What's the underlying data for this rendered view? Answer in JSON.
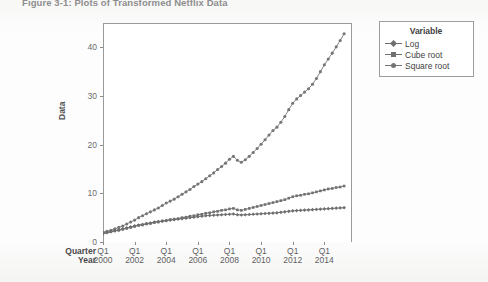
{
  "figure": {
    "title": "Figure 3-1: Plots of Transformed Netflix Data",
    "background_color": "#fbfbfa",
    "plot_background_color": "#ffffff",
    "axis_color": "#9a9a9a"
  },
  "legend": {
    "title": "Variable",
    "entries": [
      {
        "label": "Log",
        "color": "#6e6e6e",
        "marker": "diamond"
      },
      {
        "label": "Cube root",
        "color": "#707070",
        "marker": "square"
      },
      {
        "label": "Square root",
        "color": "#757575",
        "marker": "circle"
      }
    ]
  },
  "axes": {
    "y_title": "Data",
    "y_ticks": [
      "0",
      "10",
      "20",
      "30",
      "40"
    ],
    "x_row_headers": [
      "Quarter",
      "Year"
    ],
    "x_quarters": [
      "Q1",
      "Q1",
      "Q1",
      "Q1",
      "Q1",
      "Q1",
      "Q1",
      "Q1"
    ],
    "x_years": [
      "2000",
      "2002",
      "2004",
      "2006",
      "2008",
      "2010",
      "2012",
      "2014"
    ]
  },
  "chart_data": {
    "type": "line",
    "title": "Figure 3-1: Plots of Transformed Netflix Data",
    "xlabel": "Quarter / Year",
    "ylabel": "Data",
    "ylim": [
      0,
      45
    ],
    "xlim": [
      0,
      63
    ],
    "grid": false,
    "legend_position": "right-outside",
    "legend_title": "Variable",
    "x_tick_values": [
      0,
      8,
      16,
      24,
      32,
      40,
      48,
      56
    ],
    "x_tick_labels": [
      "Q1 2000",
      "Q1 2002",
      "Q1 2004",
      "Q1 2006",
      "Q1 2008",
      "Q1 2010",
      "Q1 2012",
      "Q1 2014"
    ],
    "y_tick_values": [
      0,
      10,
      20,
      30,
      40
    ],
    "x": [
      0,
      1,
      2,
      3,
      4,
      5,
      6,
      7,
      8,
      9,
      10,
      11,
      12,
      13,
      14,
      15,
      16,
      17,
      18,
      19,
      20,
      21,
      22,
      23,
      24,
      25,
      26,
      27,
      28,
      29,
      30,
      31,
      32,
      33,
      34,
      35,
      36,
      37,
      38,
      39,
      40,
      41,
      42,
      43,
      44,
      45,
      46,
      47,
      48,
      49,
      50,
      51,
      52,
      53,
      54,
      55,
      56,
      57,
      58,
      59,
      60,
      61
    ],
    "series": [
      {
        "name": "Square root",
        "marker": "circle",
        "color": "#757575",
        "values": [
          2.0,
          2.2,
          2.4,
          2.7,
          3.0,
          3.3,
          3.7,
          4.1,
          4.5,
          5.0,
          5.4,
          5.8,
          6.2,
          6.6,
          7.0,
          7.5,
          8.0,
          8.4,
          8.8,
          9.3,
          9.8,
          10.3,
          10.8,
          11.4,
          11.9,
          12.4,
          13.0,
          13.6,
          14.2,
          14.9,
          15.5,
          16.2,
          17.0,
          17.6,
          16.8,
          16.4,
          16.9,
          17.6,
          18.4,
          19.2,
          20.1,
          21.0,
          22.0,
          22.9,
          23.6,
          24.6,
          25.8,
          27.2,
          28.5,
          29.4,
          30.1,
          30.8,
          31.5,
          32.4,
          33.6,
          35.0,
          36.4,
          37.6,
          38.8,
          40.1,
          41.4,
          42.8
        ]
      },
      {
        "name": "Cube root",
        "marker": "square",
        "color": "#707070",
        "values": [
          1.9,
          2.0,
          2.1,
          2.3,
          2.4,
          2.6,
          2.8,
          3.0,
          3.2,
          3.4,
          3.5,
          3.7,
          3.8,
          4.0,
          4.1,
          4.3,
          4.4,
          4.6,
          4.7,
          4.8,
          5.0,
          5.1,
          5.3,
          5.4,
          5.6,
          5.7,
          5.9,
          6.0,
          6.2,
          6.3,
          6.5,
          6.6,
          6.8,
          6.9,
          6.6,
          6.5,
          6.7,
          6.9,
          7.1,
          7.3,
          7.5,
          7.7,
          7.9,
          8.1,
          8.3,
          8.5,
          8.7,
          9.0,
          9.3,
          9.5,
          9.6,
          9.8,
          9.9,
          10.1,
          10.3,
          10.5,
          10.7,
          10.9,
          11.0,
          11.2,
          11.3,
          11.5
        ]
      },
      {
        "name": "Log",
        "marker": "diamond",
        "color": "#6e6e6e",
        "values": [
          1.7,
          1.9,
          2.1,
          2.3,
          2.5,
          2.7,
          2.9,
          3.1,
          3.3,
          3.5,
          3.6,
          3.8,
          3.9,
          4.1,
          4.2,
          4.3,
          4.4,
          4.5,
          4.6,
          4.7,
          4.8,
          4.9,
          5.0,
          5.1,
          5.2,
          5.3,
          5.4,
          5.45,
          5.5,
          5.55,
          5.6,
          5.65,
          5.7,
          5.75,
          5.6,
          5.55,
          5.6,
          5.65,
          5.7,
          5.75,
          5.8,
          5.85,
          5.9,
          5.95,
          6.0,
          6.1,
          6.2,
          6.3,
          6.4,
          6.45,
          6.5,
          6.55,
          6.6,
          6.65,
          6.7,
          6.75,
          6.8,
          6.85,
          6.9,
          6.95,
          7.0,
          7.05
        ]
      }
    ]
  }
}
